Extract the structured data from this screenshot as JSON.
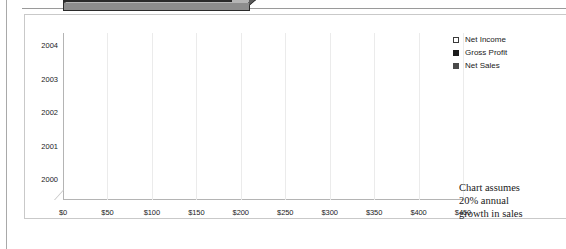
{
  "chart_data": {
    "type": "bar",
    "orientation": "horizontal",
    "grouped": true,
    "three_d": true,
    "title": "",
    "xlabel": "",
    "ylabel": "",
    "categories": [
      "2000",
      "2001",
      "2002",
      "2003",
      "2004"
    ],
    "series": [
      {
        "name": "Net Income",
        "values": [
          150,
          180,
          215,
          260,
          305
        ],
        "color": "#f7f7f7"
      },
      {
        "name": "Gross Profit",
        "values": [
          190,
          230,
          275,
          330,
          395
        ],
        "color": "#2b2b2b"
      },
      {
        "name": "Net Sales",
        "values": [
          210,
          255,
          305,
          365,
          437
        ],
        "color": "#8d8d8d"
      }
    ],
    "xlim": [
      0,
      450
    ],
    "xticks": [
      "$0",
      "$50",
      "$100",
      "$150",
      "$200",
      "$250",
      "$300",
      "$350",
      "$400",
      "$450"
    ],
    "xtick_values": [
      0,
      50,
      100,
      150,
      200,
      250,
      300,
      350,
      400,
      450
    ],
    "grid": true,
    "legend_position": "right"
  },
  "legend": {
    "items": [
      {
        "label": "Net Income",
        "marker": "open-square-marker"
      },
      {
        "label": "Gross Profit",
        "marker": "filled-square-marker"
      },
      {
        "label": "Net Sales",
        "marker": "gray-square-marker"
      }
    ]
  },
  "annotation": {
    "line1": "Chart assumes",
    "line2": "20% annual",
    "line3": "growth in sales"
  }
}
